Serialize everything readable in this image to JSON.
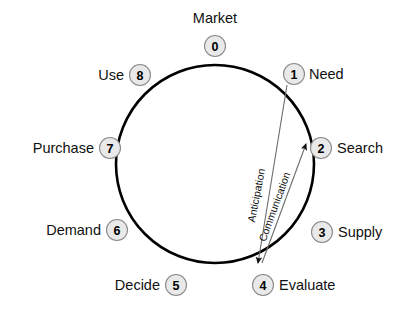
{
  "diagram": {
    "ring": {
      "center_x": 215,
      "center_y": 164,
      "radius": 99,
      "color": "#000000"
    },
    "node_style": {
      "fill": "#e9e9e9",
      "stroke": "#8a8a8a",
      "text_color": "#000000"
    },
    "nodes": [
      {
        "id": "market",
        "number": "0",
        "label": "Market",
        "label_side": "above",
        "cx": 215,
        "cy": 46,
        "lx": 215,
        "ly": 23
      },
      {
        "id": "need",
        "number": "1",
        "label": "Need",
        "label_side": "right",
        "cx": 294,
        "cy": 74,
        "lx": 309,
        "ly": 79
      },
      {
        "id": "search",
        "number": "2",
        "label": "Search",
        "label_side": "right",
        "cx": 321,
        "cy": 148,
        "lx": 337,
        "ly": 153
      },
      {
        "id": "supply",
        "number": "3",
        "label": "Supply",
        "label_side": "right",
        "cx": 322,
        "cy": 232,
        "lx": 338,
        "ly": 237
      },
      {
        "id": "evaluate",
        "number": "4",
        "label": "Evaluate",
        "label_side": "right",
        "cx": 263,
        "cy": 285,
        "lx": 279,
        "ly": 290
      },
      {
        "id": "decide",
        "number": "5",
        "label": "Decide",
        "label_side": "left",
        "cx": 176,
        "cy": 285,
        "lx": 160,
        "ly": 290
      },
      {
        "id": "demand",
        "number": "6",
        "label": "Demand",
        "label_side": "left",
        "cx": 117,
        "cy": 230,
        "lx": 101,
        "ly": 235
      },
      {
        "id": "purchase",
        "number": "7",
        "label": "Purchase",
        "label_side": "left",
        "cx": 110,
        "cy": 148,
        "lx": 94,
        "ly": 153
      },
      {
        "id": "use",
        "number": "8",
        "label": "Use",
        "label_side": "left",
        "cx": 140,
        "cy": 75,
        "lx": 124,
        "ly": 80
      }
    ],
    "arrows": [
      {
        "id": "anticipation",
        "label": "Anticipation",
        "from_label": "Need",
        "to_label": "Evaluate",
        "x1": 287,
        "y1": 85,
        "x2": 258,
        "y2": 263,
        "label_x": 260,
        "label_y": 196,
        "label_rotate": -79
      },
      {
        "id": "communication",
        "label": "Communication",
        "from_label": "Evaluate",
        "to_label": "Search",
        "x1": 262,
        "y1": 263,
        "x2": 306,
        "y2": 144,
        "label_x": 278,
        "label_y": 208,
        "label_rotate": -70
      }
    ]
  }
}
